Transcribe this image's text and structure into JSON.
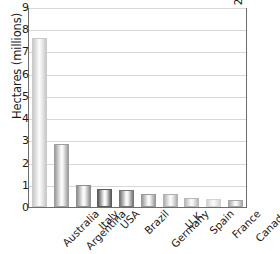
{
  "chart_data": {
    "type": "bar",
    "title": "",
    "xlabel": "",
    "ylabel": "Hectares (millions)",
    "categories": [
      "Australia",
      "Argentina",
      "Italy",
      "USA",
      "Brazil",
      "Germany",
      "U.K.",
      "Spain",
      "France",
      "Canada"
    ],
    "values": [
      7.7,
      2.85,
      1.0,
      0.83,
      0.76,
      0.59,
      0.58,
      0.43,
      0.38,
      0.34
    ],
    "ylim": [
      0,
      9
    ],
    "yticks": [
      0,
      1,
      2,
      3,
      4,
      5,
      6,
      7,
      8,
      9
    ],
    "ytick_labels": [
      "0",
      "1",
      "2",
      "3",
      "4",
      "5",
      "6",
      "7",
      "8",
      "9"
    ],
    "grid": true,
    "legend": false,
    "legend_position": "none",
    "annotations": [
      "adapted from SOEL-Survey, February 2002"
    ],
    "bar_colors": [
      "#c9c9c9",
      "#9e9e9e",
      "#8f8f8f",
      "#5a5a5a",
      "#767676",
      "#9a9a9a",
      "#b0b0b0",
      "#b8b8b8",
      "#d2d2d2",
      "#a8a8a8"
    ]
  },
  "figure": {
    "y_axis_title": "Hectares (millions)",
    "source_credit": "adapted from SOEL-Survey, February 2002"
  },
  "colors": {
    "frame": "#6d6d6d",
    "gridline": "#d8d8d8",
    "text": "#1a1a1a",
    "background": "#ffffff"
  }
}
